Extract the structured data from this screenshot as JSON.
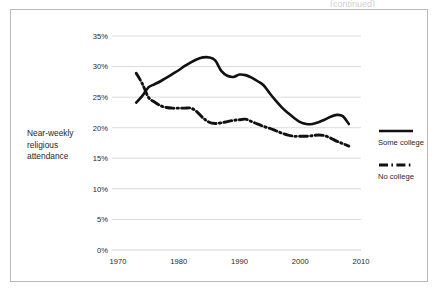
{
  "figure": {
    "top_clip_text": "(continued)"
  },
  "axis_title": {
    "line1": "Near-weekly",
    "line2": "religious",
    "line3": "attendance"
  },
  "legend": {
    "position": "right",
    "entries": [
      {
        "label": "Some college",
        "style": "solid",
        "color": "#111111",
        "swatch_name": "legend-swatch-solid"
      },
      {
        "label": "No college",
        "style": "dash-dot",
        "color": "#111111",
        "swatch_name": "legend-swatch-dashdot"
      }
    ]
  },
  "chart_data": {
    "type": "line",
    "title": "",
    "subtitle": "",
    "xlabel": "",
    "ylabel": "Near-weekly religious attendance",
    "xlim": [
      1970,
      2010
    ],
    "ylim": [
      0,
      35
    ],
    "grid": true,
    "xticks": [
      1970,
      1980,
      1990,
      2000,
      2010
    ],
    "xtick_labels": [
      "1970",
      "1980",
      "1990",
      "2000",
      "2010"
    ],
    "yticks": [
      0,
      5,
      10,
      15,
      20,
      25,
      30,
      35
    ],
    "ytick_labels": [
      "0%",
      "5%",
      "10%",
      "15%",
      "20%",
      "25%",
      "30%",
      "35%"
    ],
    "series": [
      {
        "name": "Some college",
        "style": "solid",
        "color": "#111111",
        "x": [
          1973,
          1974,
          1975,
          1976,
          1977,
          1978,
          1979,
          1980,
          1981,
          1982,
          1983,
          1984,
          1985,
          1986,
          1987,
          1988,
          1989,
          1990,
          1991,
          1992,
          1993,
          1994,
          1995,
          1996,
          1997,
          1998,
          1999,
          2000,
          2001,
          2002,
          2003,
          2004,
          2005,
          2006,
          2007,
          2008
        ],
        "values": [
          24.1,
          25.2,
          26.6,
          27.1,
          27.6,
          28.2,
          28.8,
          29.4,
          30.1,
          30.7,
          31.2,
          31.5,
          31.5,
          31.0,
          29.3,
          28.5,
          28.3,
          28.7,
          28.6,
          28.2,
          27.6,
          26.9,
          25.6,
          24.4,
          23.3,
          22.4,
          21.6,
          20.9,
          20.6,
          20.6,
          20.9,
          21.3,
          21.8,
          22.1,
          21.9,
          20.6
        ]
      },
      {
        "name": "No college",
        "style": "dash-dot",
        "color": "#111111",
        "x": [
          1973,
          1974,
          1975,
          1976,
          1977,
          1978,
          1979,
          1980,
          1981,
          1982,
          1983,
          1984,
          1985,
          1986,
          1987,
          1988,
          1989,
          1990,
          1991,
          1992,
          1993,
          1994,
          1995,
          1996,
          1997,
          1998,
          1999,
          2000,
          2001,
          2002,
          2003,
          2004,
          2005,
          2006,
          2007,
          2008
        ],
        "values": [
          28.9,
          27.2,
          25.0,
          24.2,
          23.6,
          23.3,
          23.2,
          23.2,
          23.2,
          23.2,
          22.6,
          21.6,
          20.9,
          20.7,
          20.8,
          21.0,
          21.2,
          21.3,
          21.4,
          21.0,
          20.6,
          20.2,
          19.9,
          19.5,
          19.1,
          18.8,
          18.6,
          18.6,
          18.6,
          18.7,
          18.8,
          18.7,
          18.3,
          17.8,
          17.4,
          17.0
        ]
      }
    ]
  }
}
